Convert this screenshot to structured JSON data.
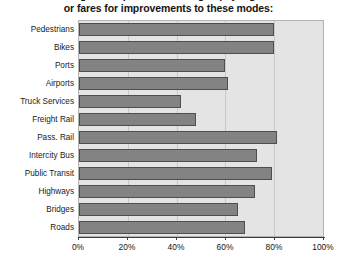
{
  "chart": {
    "title": "Percentage of respondents willing to pay higher taxes\nor fares for improvements to these modes:",
    "title_visible": "or fares for improvements to these modes:"
  },
  "chart_data": {
    "type": "bar",
    "orientation": "horizontal",
    "title": "or fares for improvements to these modes:",
    "xlabel": "",
    "ylabel": "",
    "xlim": [
      0,
      100
    ],
    "grid": true,
    "legend": false,
    "bar_color": "#838383",
    "bar_border_color": "#4e4e4e",
    "plot_background": "#e4e4e4",
    "tick_labels": [
      "0%",
      "20%",
      "40%",
      "60%",
      "80%",
      "100%"
    ],
    "tick_values": [
      0,
      20,
      40,
      60,
      80,
      100
    ],
    "categories": [
      "Pedestrians",
      "Bikes",
      "Ports",
      "Airports",
      "Truck Services",
      "Freight Rail",
      "Pass. Rail",
      "Intercity Bus",
      "Public Transit",
      "Highways",
      "Bridges",
      "Roads"
    ],
    "values": [
      80,
      80,
      60,
      61,
      42,
      48,
      81,
      73,
      79,
      72,
      65,
      68
    ]
  }
}
